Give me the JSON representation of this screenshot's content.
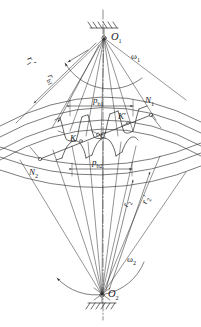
{
  "figure": {
    "stroke_color": "#2b2b2b",
    "background": "#ffffff"
  },
  "centers": {
    "top": {
      "label": "O",
      "sub": "1",
      "x": 104,
      "y": 38
    },
    "bottom": {
      "label": "O",
      "sub": "2",
      "x": 102,
      "y": 295
    }
  },
  "angular_velocities": {
    "top": {
      "label": "ω",
      "sub": "1",
      "x": 131,
      "y": 52
    },
    "bottom": {
      "label": "ω",
      "sub": "2",
      "x": 127,
      "y": 258
    }
  },
  "radii_labels": [
    {
      "name": "r1-prime",
      "base": "r",
      "sub": "1",
      "prime": "′",
      "x": 35,
      "y": 57
    },
    {
      "name": "rb1",
      "base": "r",
      "sub": "b1",
      "prime": "",
      "x": 55,
      "y": 75
    },
    {
      "name": "r2",
      "base": "r",
      "sub": "2",
      "prime": "",
      "x": 122,
      "y": 203
    },
    {
      "name": "r2-prime",
      "base": "r",
      "sub": "2",
      "prime": "′",
      "x": 141,
      "y": 200
    }
  ],
  "mesh_points": [
    {
      "name": "N1",
      "base": "N",
      "sub": "1",
      "prime": "",
      "x": 147,
      "y": 100,
      "px": 151,
      "py": 115
    },
    {
      "name": "N2",
      "base": "N",
      "sub": "2",
      "prime": "",
      "x": 31,
      "y": 172,
      "px": 40,
      "py": 159
    },
    {
      "name": "K",
      "base": "K",
      "sub": "",
      "prime": "",
      "x": 71,
      "y": 138,
      "px": 81,
      "py": 139
    },
    {
      "name": "K-prime",
      "base": "K",
      "sub": "",
      "prime": "′",
      "x": 119,
      "y": 117,
      "px": 128,
      "py": 121
    },
    {
      "name": "C",
      "base": "C",
      "sub": "",
      "prime": "",
      "x": 101,
      "y": 136,
      "px": 98,
      "py": 131
    }
  ],
  "dimensions": [
    {
      "name": "pb1",
      "base": "p",
      "sub": "b1",
      "x": 93,
      "y": 99,
      "x1": 70,
      "x2": 133,
      "y_line": 106
    },
    {
      "name": "pb2",
      "base": "p",
      "sub": "b2",
      "x": 93,
      "y": 161,
      "x1": 72,
      "x2": 132,
      "y_line": 169
    }
  ],
  "supports": [
    {
      "name": "ground-hatch-top",
      "x": 104,
      "y": 28
    },
    {
      "name": "ground-hatch-bottom",
      "x": 102,
      "y": 303
    }
  ]
}
